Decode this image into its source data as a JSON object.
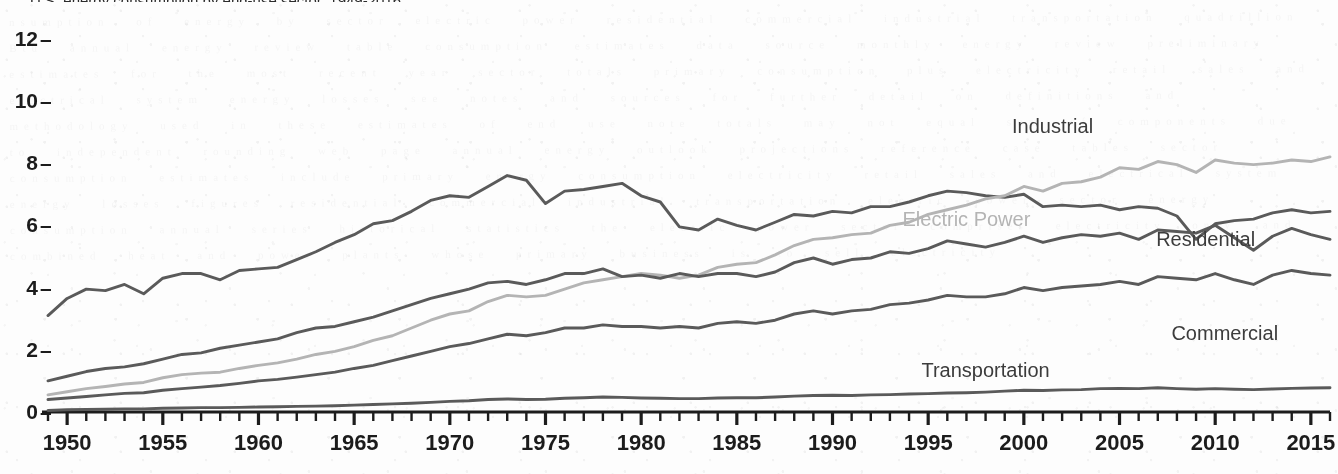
{
  "title": "U.S. energy consumption by end-use sector, 1949-2016",
  "chart_data": {
    "type": "line",
    "title": "U.S. energy consumption by end-use sector, 1949-2016",
    "xlabel": "",
    "ylabel": "quadrillion Btu",
    "xlim": [
      1949,
      2016
    ],
    "ylim": [
      0,
      12.6
    ],
    "grid": false,
    "legend_position": "inline-right",
    "y_ticks": [
      0,
      2,
      4,
      6,
      8,
      10,
      12
    ],
    "x_ticks": [
      1950,
      1955,
      1960,
      1965,
      1970,
      1975,
      1980,
      1985,
      1990,
      1995,
      2000,
      2005,
      2010,
      2015
    ],
    "x_minor_tick_interval": 1,
    "x": [
      1949,
      1950,
      1951,
      1952,
      1953,
      1954,
      1955,
      1956,
      1957,
      1958,
      1959,
      1960,
      1961,
      1962,
      1963,
      1964,
      1965,
      1966,
      1967,
      1968,
      1969,
      1970,
      1971,
      1972,
      1973,
      1974,
      1975,
      1976,
      1977,
      1978,
      1979,
      1980,
      1981,
      1982,
      1983,
      1984,
      1985,
      1986,
      1987,
      1988,
      1989,
      1990,
      1991,
      1992,
      1993,
      1994,
      1995,
      1996,
      1997,
      1998,
      1999,
      2000,
      2001,
      2002,
      2003,
      2004,
      2005,
      2006,
      2007,
      2008,
      2009,
      2010,
      2011,
      2012,
      2013,
      2014,
      2015,
      2016
    ],
    "series": [
      {
        "name": "Industrial",
        "color": "#5a5a5a",
        "label_x": 2001.5,
        "label_y": 9.2,
        "values": [
          3.1,
          3.65,
          3.95,
          3.9,
          4.1,
          3.8,
          4.3,
          4.45,
          4.45,
          4.25,
          4.55,
          4.6,
          4.65,
          4.9,
          5.15,
          5.45,
          5.7,
          6.05,
          6.15,
          6.45,
          6.8,
          6.95,
          6.9,
          7.25,
          7.6,
          7.45,
          6.7,
          7.1,
          7.15,
          7.25,
          7.35,
          6.95,
          6.75,
          5.95,
          5.85,
          6.2,
          6.0,
          5.85,
          6.1,
          6.35,
          6.3,
          6.45,
          6.4,
          6.6,
          6.6,
          6.75,
          6.95,
          7.1,
          7.05,
          6.95,
          6.9,
          7.0,
          6.6,
          6.65,
          6.6,
          6.65,
          6.5,
          6.6,
          6.55,
          6.3,
          5.55,
          6.05,
          6.15,
          6.2,
          6.4,
          6.5,
          6.4,
          6.45
        ]
      },
      {
        "name": "Electric Power",
        "color": "#b4b4b4",
        "label_x": 1997.0,
        "label_y": 6.2,
        "values": [
          0.55,
          0.65,
          0.75,
          0.82,
          0.9,
          0.95,
          1.1,
          1.2,
          1.25,
          1.28,
          1.4,
          1.5,
          1.58,
          1.7,
          1.85,
          1.95,
          2.1,
          2.3,
          2.45,
          2.7,
          2.95,
          3.15,
          3.25,
          3.55,
          3.75,
          3.7,
          3.75,
          3.95,
          4.15,
          4.25,
          4.35,
          4.45,
          4.4,
          4.3,
          4.4,
          4.65,
          4.75,
          4.8,
          5.05,
          5.35,
          5.55,
          5.6,
          5.7,
          5.75,
          6.0,
          6.1,
          6.35,
          6.5,
          6.65,
          6.85,
          6.95,
          7.25,
          7.1,
          7.35,
          7.4,
          7.55,
          7.85,
          7.8,
          8.05,
          7.95,
          7.7,
          8.1,
          8.0,
          7.95,
          8.0,
          8.1,
          8.05,
          8.2
        ]
      },
      {
        "name": "Residential",
        "color": "#5a5a5a",
        "label_x": 2009.5,
        "label_y": 5.55,
        "values": [
          1.0,
          1.15,
          1.3,
          1.4,
          1.45,
          1.55,
          1.7,
          1.85,
          1.9,
          2.05,
          2.15,
          2.25,
          2.35,
          2.55,
          2.7,
          2.75,
          2.9,
          3.05,
          3.25,
          3.45,
          3.65,
          3.8,
          3.95,
          4.15,
          4.2,
          4.1,
          4.25,
          4.45,
          4.45,
          4.6,
          4.35,
          4.4,
          4.3,
          4.45,
          4.35,
          4.45,
          4.45,
          4.35,
          4.5,
          4.8,
          4.95,
          4.75,
          4.9,
          4.95,
          5.15,
          5.1,
          5.25,
          5.5,
          5.4,
          5.3,
          5.45,
          5.65,
          5.45,
          5.6,
          5.7,
          5.65,
          5.75,
          5.55,
          5.85,
          5.8,
          5.75,
          6.0,
          5.6,
          5.2,
          5.65,
          5.9,
          5.7,
          5.55
        ]
      },
      {
        "name": "Commercial",
        "color": "#5a5a5a",
        "label_x": 2010.5,
        "label_y": 2.55,
        "values": [
          0.4,
          0.45,
          0.5,
          0.55,
          0.6,
          0.62,
          0.7,
          0.75,
          0.8,
          0.85,
          0.92,
          1.0,
          1.05,
          1.12,
          1.2,
          1.28,
          1.4,
          1.5,
          1.65,
          1.8,
          1.95,
          2.1,
          2.2,
          2.35,
          2.5,
          2.45,
          2.55,
          2.7,
          2.7,
          2.8,
          2.75,
          2.75,
          2.7,
          2.75,
          2.7,
          2.85,
          2.9,
          2.85,
          2.95,
          3.15,
          3.25,
          3.15,
          3.25,
          3.3,
          3.45,
          3.5,
          3.6,
          3.75,
          3.7,
          3.7,
          3.8,
          4.0,
          3.9,
          4.0,
          4.05,
          4.1,
          4.2,
          4.1,
          4.35,
          4.3,
          4.25,
          4.45,
          4.25,
          4.1,
          4.4,
          4.55,
          4.45,
          4.4
        ]
      },
      {
        "name": "Transportation",
        "color": "#5a5a5a",
        "label_x": 1998.0,
        "label_y": 1.35,
        "values": [
          0.05,
          0.07,
          0.08,
          0.09,
          0.1,
          0.1,
          0.12,
          0.13,
          0.14,
          0.14,
          0.15,
          0.16,
          0.17,
          0.18,
          0.19,
          0.2,
          0.22,
          0.24,
          0.26,
          0.28,
          0.31,
          0.34,
          0.36,
          0.4,
          0.42,
          0.4,
          0.41,
          0.44,
          0.46,
          0.48,
          0.47,
          0.45,
          0.44,
          0.43,
          0.43,
          0.45,
          0.46,
          0.46,
          0.48,
          0.51,
          0.53,
          0.54,
          0.53,
          0.55,
          0.56,
          0.58,
          0.59,
          0.61,
          0.62,
          0.64,
          0.67,
          0.7,
          0.69,
          0.71,
          0.72,
          0.75,
          0.76,
          0.75,
          0.78,
          0.75,
          0.73,
          0.75,
          0.73,
          0.72,
          0.74,
          0.76,
          0.77,
          0.78
        ]
      }
    ]
  }
}
